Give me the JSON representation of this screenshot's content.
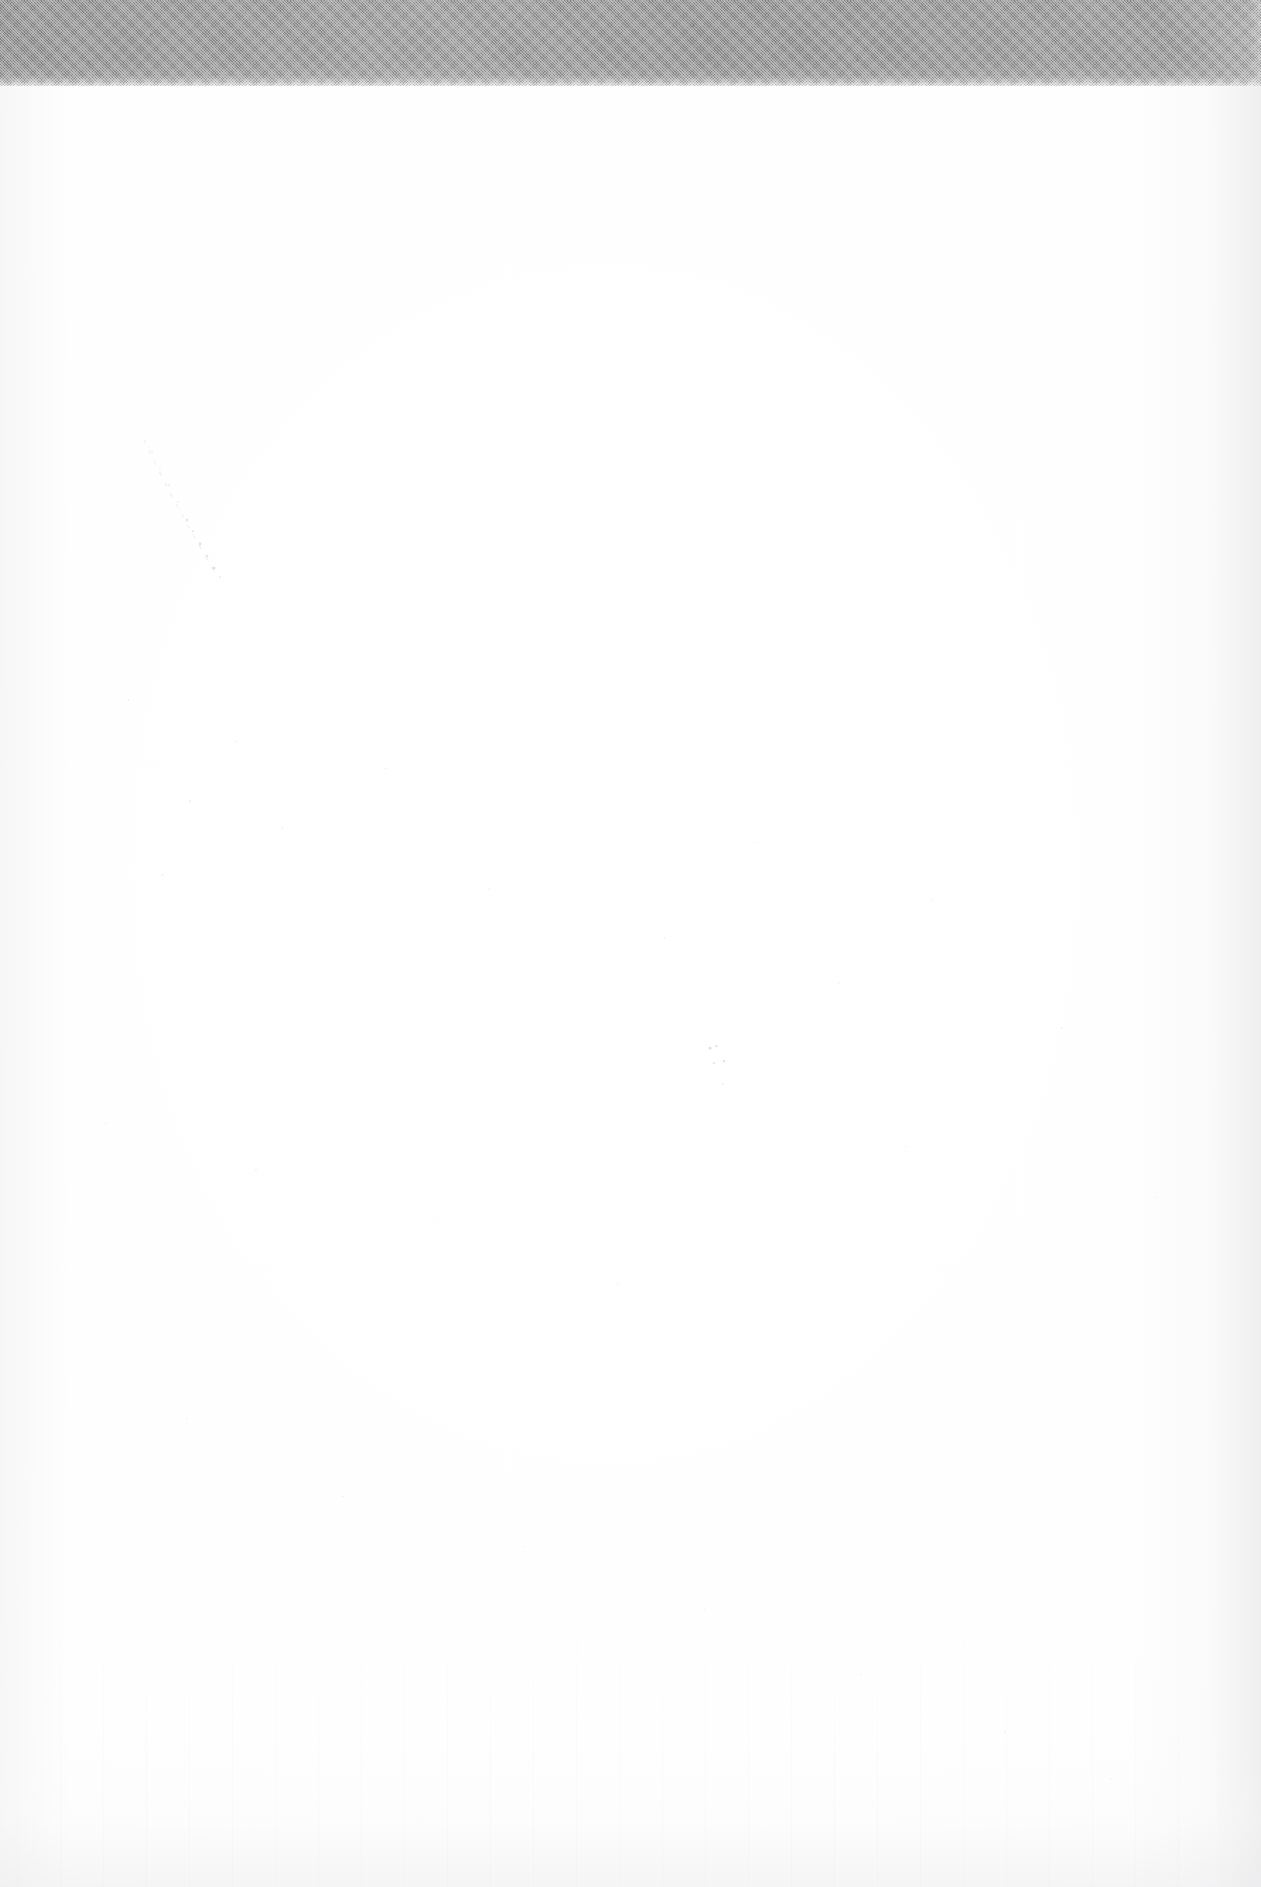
{
  "document": {
    "kind": "scanned-page",
    "orientation": "portrait",
    "page_width_px": 1261,
    "page_height_px": 1887,
    "body_text": "",
    "note": ""
  },
  "top_band": {
    "name": "gray-halftone-band",
    "height_px": 86,
    "color": "#9a9a9a",
    "texture": "halftone-dither",
    "label": ""
  },
  "paper": {
    "base_color": "#fefefe",
    "grain_color": "#787880",
    "vignette_color": "#f2f2f4",
    "edge_shade_color": "#e2e2e4"
  },
  "artifacts": {
    "smudge": {
      "name": "diagonal-smudge-trail",
      "color": "#b9b9c0",
      "region": "upper-left"
    },
    "fleck": {
      "name": "ink-fleck-cluster",
      "color": "#82828a",
      "region": "center"
    },
    "streaks": {
      "name": "scanner-streaks",
      "color": "#a5a5ac",
      "region": "bottom"
    }
  }
}
